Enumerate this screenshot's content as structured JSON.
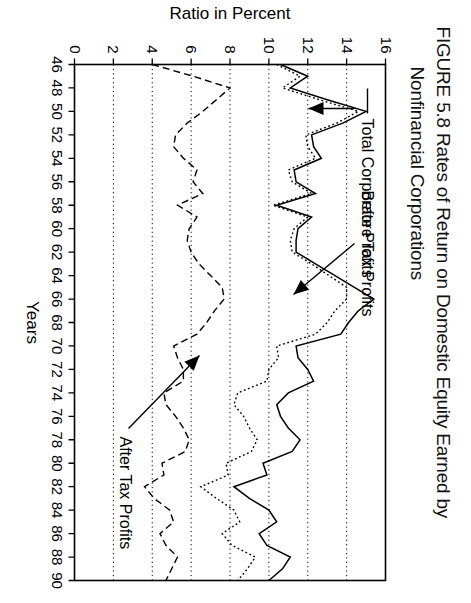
{
  "figure": {
    "title_line1": "FIGURE 5.8 Rates of Return on Domestic Equity Earned by",
    "title_line2": "Nonfinancial Corporations"
  },
  "chart_data": {
    "type": "line",
    "title": "FIGURE 5.8 Rates of Return on Domestic Equity Earned by Nonfinancial Corporations",
    "xlabel": "Years",
    "ylabel": "Ratio in Percent",
    "xlim": [
      46,
      90
    ],
    "ylim": [
      0,
      16
    ],
    "xticks": [
      46,
      48,
      50,
      52,
      54,
      56,
      58,
      60,
      62,
      64,
      66,
      68,
      70,
      72,
      74,
      76,
      78,
      80,
      82,
      84,
      86,
      88,
      90
    ],
    "xticklabels": [
      "46",
      "48",
      "50",
      "52",
      "54",
      "56",
      "58",
      "60",
      "62",
      "64",
      "66",
      "68",
      "70",
      "72",
      "74",
      "76",
      "78",
      "80",
      "82",
      "84",
      "86",
      "88",
      "90"
    ],
    "yticks": [
      0,
      2,
      4,
      6,
      8,
      10,
      12,
      14,
      16
    ],
    "yticklabels": [
      "0",
      "2",
      "4",
      "6",
      "8",
      "10",
      "12",
      "14",
      "16"
    ],
    "grid": "y-gridlines dotted",
    "legend": "inline annotations with arrows",
    "annotations": [
      {
        "label": "Total Corporate Profits",
        "style": "solid",
        "arrow": "down to solid curve near 1965"
      },
      {
        "label": "Before Tax Profits",
        "style": "dotted",
        "arrow": "right to dotted curve near 1972"
      },
      {
        "label": "After Tax Profits",
        "style": "dashed",
        "arrow": "up-left to dashed curve near 1968"
      }
    ],
    "x": [
      46,
      47,
      48,
      49,
      50,
      51,
      52,
      53,
      54,
      55,
      56,
      57,
      58,
      59,
      60,
      61,
      62,
      63,
      64,
      65,
      66,
      67,
      68,
      69,
      70,
      71,
      72,
      73,
      74,
      75,
      76,
      77,
      78,
      79,
      80,
      81,
      82,
      83,
      84,
      85,
      86,
      87,
      88,
      89,
      90
    ],
    "series": [
      {
        "name": "Total Corporate Profits",
        "style": "solid",
        "values": [
          10.6,
          12.0,
          11.1,
          13.0,
          15.0,
          13.8,
          12.2,
          12.3,
          12.7,
          11.3,
          11.4,
          12.4,
          10.4,
          12.2,
          11.5,
          11.4,
          11.4,
          12.4,
          13.4,
          14.4,
          15.4,
          14.6,
          14.1,
          13.7,
          11.4,
          11.5,
          12.0,
          12.3,
          11.0,
          10.4,
          10.6,
          11.0,
          11.6,
          11.2,
          9.7,
          9.9,
          8.2,
          9.0,
          10.0,
          10.4,
          9.5,
          9.9,
          11.1,
          10.7,
          10.0
        ]
      },
      {
        "name": "Before Tax Profits",
        "style": "dotted",
        "values": [
          10.4,
          11.6,
          10.7,
          12.6,
          14.6,
          13.5,
          11.9,
          12.0,
          12.4,
          11.0,
          11.2,
          12.2,
          10.2,
          12.0,
          11.3,
          11.1,
          11.2,
          12.2,
          13.1,
          14.0,
          14.0,
          13.4,
          13.0,
          12.4,
          10.4,
          10.5,
          10.0,
          9.9,
          8.4,
          8.2,
          8.7,
          9.0,
          9.4,
          9.1,
          7.8,
          7.9,
          6.5,
          7.3,
          8.2,
          8.5,
          7.6,
          8.1,
          9.3,
          8.9,
          8.4
        ]
      },
      {
        "name": "After Tax Profits",
        "style": "dashed",
        "values": [
          4.0,
          6.1,
          8.0,
          7.3,
          6.6,
          5.8,
          5.2,
          5.1,
          5.6,
          6.3,
          6.1,
          6.6,
          5.3,
          6.3,
          5.9,
          5.8,
          6.0,
          6.4,
          7.0,
          7.6,
          7.7,
          7.2,
          6.8,
          6.3,
          5.1,
          5.3,
          5.6,
          5.6,
          4.6,
          4.7,
          5.2,
          5.6,
          5.9,
          5.7,
          4.5,
          4.6,
          3.6,
          4.1,
          4.9,
          5.1,
          4.4,
          4.7,
          5.3,
          5.0,
          4.7
        ]
      }
    ]
  },
  "axis": {
    "x_label": "Years",
    "y_label": "Ratio in Percent"
  }
}
